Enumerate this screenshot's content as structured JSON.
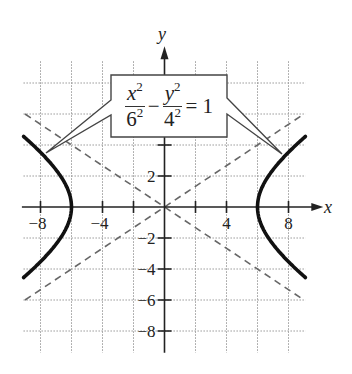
{
  "chart_data": {
    "type": "line",
    "title": "",
    "xlabel": "x",
    "ylabel": "y",
    "xlim": [
      -9.2,
      9.2
    ],
    "ylim": [
      -9.2,
      9.2
    ],
    "grid": true,
    "grid_step": 2,
    "x_ticks": [
      -8,
      -6,
      -4,
      -2,
      2,
      4,
      6,
      8
    ],
    "x_tick_labels": [
      "-8",
      "-4",
      "4",
      "8"
    ],
    "y_ticks": [
      -8,
      -6,
      -4,
      -2,
      2,
      4,
      6,
      8
    ],
    "y_tick_labels": [
      "2",
      "-2",
      "-4",
      "-6",
      "-8"
    ],
    "annotation": {
      "equation": "x^2/6^2 - y^2/4^2 = 1",
      "num1": "x",
      "exp1": "2",
      "den1": "6",
      "dexp1": "2",
      "minus": "−",
      "num2": "y",
      "exp2": "2",
      "den2": "4",
      "dexp2": "2",
      "rhs": "= 1"
    },
    "series": [
      {
        "name": "Hyperbola right branch",
        "style": "solid-thick",
        "a": 6,
        "b": 4,
        "x_range": [
          6,
          9
        ],
        "points": [
          [
            9.0,
            -4.47
          ],
          [
            8,
            -3.53
          ],
          [
            7,
            -2.06
          ],
          [
            6,
            0
          ],
          [
            7,
            2.06
          ],
          [
            8,
            3.53
          ],
          [
            9.0,
            4.47
          ]
        ]
      },
      {
        "name": "Hyperbola left branch",
        "style": "solid-thick",
        "a": 6,
        "b": 4,
        "x_range": [
          -9,
          -6
        ],
        "points": [
          [
            -9.0,
            -4.47
          ],
          [
            -8,
            -3.53
          ],
          [
            -7,
            -2.06
          ],
          [
            -6,
            0
          ],
          [
            -7,
            2.06
          ],
          [
            -8,
            3.53
          ],
          [
            -9.0,
            4.47
          ]
        ]
      },
      {
        "name": "Asymptote y = (2/3)x",
        "style": "dashed",
        "points": [
          [
            -9,
            -6
          ],
          [
            9,
            6
          ]
        ]
      },
      {
        "name": "Asymptote y = -(2/3)x",
        "style": "dashed",
        "points": [
          [
            -9,
            6
          ],
          [
            9,
            -6
          ]
        ]
      }
    ]
  }
}
